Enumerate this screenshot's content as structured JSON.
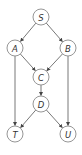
{
  "diagram": {
    "type": "directed-acyclic-graph",
    "colors": {
      "node_stroke": "#8a8a8a",
      "edge": "#555555",
      "label": "#333333",
      "background": "#ffffff"
    },
    "nodes": [
      {
        "id": "S",
        "label": "S",
        "x": 41,
        "y": 17
      },
      {
        "id": "A",
        "label": "A",
        "x": 15,
        "y": 48
      },
      {
        "id": "B",
        "label": "B",
        "x": 68,
        "y": 48
      },
      {
        "id": "C",
        "label": "C",
        "x": 41,
        "y": 77
      },
      {
        "id": "D",
        "label": "D",
        "x": 41,
        "y": 104
      },
      {
        "id": "T",
        "label": "T",
        "x": 15,
        "y": 134
      },
      {
        "id": "U",
        "label": "U",
        "x": 68,
        "y": 134
      }
    ],
    "edges": [
      {
        "from": "S",
        "to": "A"
      },
      {
        "from": "S",
        "to": "B"
      },
      {
        "from": "A",
        "to": "C"
      },
      {
        "from": "B",
        "to": "C"
      },
      {
        "from": "C",
        "to": "D"
      },
      {
        "from": "A",
        "to": "T"
      },
      {
        "from": "B",
        "to": "U"
      },
      {
        "from": "D",
        "to": "T"
      },
      {
        "from": "D",
        "to": "U"
      }
    ]
  }
}
